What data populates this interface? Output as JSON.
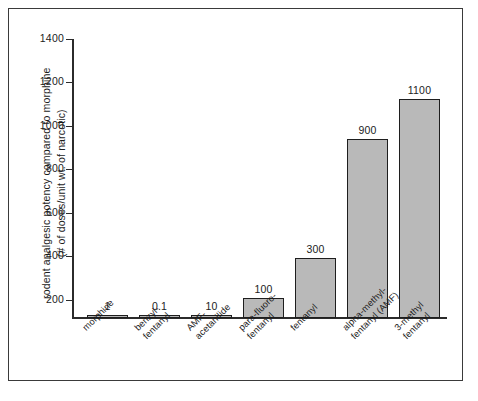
{
  "chart_data": {
    "type": "bar",
    "title": "",
    "xlabel": "",
    "ylabel": "rodent analgesic potency compared to morphine (# of doses/unit wt. of narcotic)",
    "ylabel_lines": [
      "rodent analgesic potency compared to morphine",
      "(# of doses/unit wt. of narcotic)"
    ],
    "ylim": [
      0,
      1400
    ],
    "ytick_values": [
      200,
      400,
      600,
      800,
      1000,
      1200,
      1400
    ],
    "ytick_labels": [
      "200",
      "400",
      "600",
      "800",
      "1000",
      "1200",
      "1400"
    ],
    "grid": false,
    "legend": null,
    "categories": [
      "morphine",
      "benzyl-fentanyl",
      "AMF-acetanilide",
      "para-fluoro-fentanyl",
      "fentanyl",
      "alpha-methyl-fentanyl (AMF)",
      "3-methyl fentanyl"
    ],
    "category_label_lines": [
      [
        "morphine"
      ],
      [
        "benzyl-",
        "fentanyl"
      ],
      [
        "AMF-",
        "acetanilide"
      ],
      [
        "para-fluoro-",
        "fentanyl"
      ],
      [
        "fentanyl"
      ],
      [
        "alpha-methyl-",
        "fentanyl (AMF)"
      ],
      [
        "3-methyl",
        "fentanyl"
      ]
    ],
    "values": [
      1,
      0.1,
      10,
      100,
      300,
      900,
      1100
    ],
    "value_labels": [
      "1",
      "0.1",
      "10",
      "100",
      "300",
      "900",
      "1100"
    ],
    "bar_color": "#b9b9b9",
    "bar_edge_color": "#1e1e1e",
    "axis_color": "#2b2b2b",
    "background_color": "#ffffff",
    "frame_color": "#3a3a3a"
  }
}
